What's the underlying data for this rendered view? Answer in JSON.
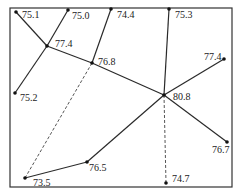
{
  "diagram": {
    "frame": {
      "x": 10,
      "y": 8,
      "w": 222,
      "h": 179
    },
    "nodes": [
      {
        "id": "n1",
        "label": "75.1",
        "x": 16,
        "y": 12,
        "lx": 22,
        "ly": 18
      },
      {
        "id": "n2",
        "label": "75.0",
        "x": 68,
        "y": 10,
        "lx": 72,
        "ly": 19
      },
      {
        "id": "n3",
        "label": "74.4",
        "x": 111,
        "y": 9,
        "lx": 117,
        "ly": 18
      },
      {
        "id": "n4",
        "label": "75.3",
        "x": 169,
        "y": 9,
        "lx": 175,
        "ly": 18
      },
      {
        "id": "n5",
        "label": "77.4",
        "x": 47,
        "y": 46,
        "lx": 55,
        "ly": 47
      },
      {
        "id": "n6",
        "label": "76.8",
        "x": 92,
        "y": 63,
        "lx": 98,
        "ly": 65
      },
      {
        "id": "n7",
        "label": "75.2",
        "x": 15,
        "y": 93,
        "lx": 20,
        "ly": 101
      },
      {
        "id": "n8",
        "label": "77.4",
        "x": 224,
        "y": 59,
        "lx": 204,
        "ly": 60
      },
      {
        "id": "n9",
        "label": "80.8",
        "x": 164,
        "y": 95,
        "lx": 173,
        "ly": 100
      },
      {
        "id": "n10",
        "label": "76.7",
        "x": 227,
        "y": 142,
        "lx": 212,
        "ly": 153
      },
      {
        "id": "n11",
        "label": "76.5",
        "x": 87,
        "y": 162,
        "lx": 89,
        "ly": 171
      },
      {
        "id": "n12",
        "label": "73.5",
        "x": 25,
        "y": 178,
        "lx": 33,
        "ly": 186
      },
      {
        "id": "n13",
        "label": "74.7",
        "x": 166,
        "y": 183,
        "lx": 172,
        "ly": 182
      }
    ],
    "edges": [
      {
        "from": "n1",
        "to": "n5",
        "style": "solid"
      },
      {
        "from": "n2",
        "to": "n5",
        "style": "solid"
      },
      {
        "from": "n5",
        "to": "n7",
        "style": "solid"
      },
      {
        "from": "n5",
        "to": "n6",
        "style": "solid"
      },
      {
        "from": "n3",
        "to": "n6",
        "style": "solid"
      },
      {
        "from": "n6",
        "to": "n9",
        "style": "solid"
      },
      {
        "from": "n4",
        "to": "n9",
        "style": "solid"
      },
      {
        "from": "n8",
        "to": "n9",
        "style": "solid"
      },
      {
        "from": "n9",
        "to": "n10",
        "style": "solid"
      },
      {
        "from": "n9",
        "to": "n11",
        "style": "solid"
      },
      {
        "from": "n11",
        "to": "n12",
        "style": "solid"
      },
      {
        "from": "n12",
        "to": "n6",
        "style": "dashed"
      },
      {
        "from": "n9",
        "to": "n13",
        "style": "dashed"
      }
    ]
  }
}
